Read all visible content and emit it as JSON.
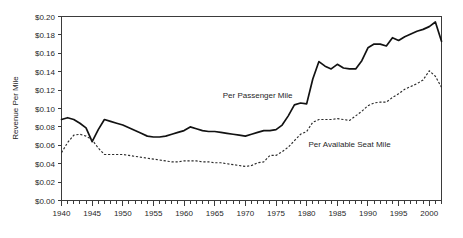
{
  "chart_data": {
    "type": "line",
    "title": "",
    "subtitle": "",
    "xlabel": "",
    "ylabel": "Revenue Per Mile",
    "xlim": [
      1940,
      2002
    ],
    "ylim": [
      0.0,
      0.2
    ],
    "grid": false,
    "legend_position": "inline-annotations",
    "y_tick_labels": [
      "$0.20",
      "$0.18",
      "$0.16",
      "$0.14",
      "$0.12",
      "$0.10",
      "$0.08",
      "$0.06",
      "$0.04",
      "$0.02",
      "$0.00"
    ],
    "y_tick_values": [
      0.2,
      0.18,
      0.16,
      0.14,
      0.12,
      0.1,
      0.08,
      0.06,
      0.04,
      0.02,
      0.0
    ],
    "x_tick_labels": [
      "1940",
      "1945",
      "1950",
      "1955",
      "1960",
      "1965",
      "1970",
      "1975",
      "1980",
      "1985",
      "1990",
      "1995",
      "2000"
    ],
    "x_tick_values": [
      1940,
      1945,
      1950,
      1955,
      1960,
      1965,
      1970,
      1975,
      1980,
      1985,
      1990,
      1995,
      2000
    ],
    "x_minor_tick_step": 1,
    "x": [
      1940,
      1941,
      1942,
      1943,
      1944,
      1945,
      1946,
      1947,
      1948,
      1949,
      1950,
      1951,
      1952,
      1953,
      1954,
      1955,
      1956,
      1957,
      1958,
      1959,
      1960,
      1961,
      1962,
      1963,
      1964,
      1965,
      1966,
      1967,
      1968,
      1969,
      1970,
      1971,
      1972,
      1973,
      1974,
      1975,
      1976,
      1977,
      1978,
      1979,
      1980,
      1981,
      1982,
      1983,
      1984,
      1985,
      1986,
      1987,
      1988,
      1989,
      1990,
      1991,
      1992,
      1993,
      1994,
      1995,
      1996,
      1997,
      1998,
      1999,
      2000,
      2001,
      2002
    ],
    "series": [
      {
        "name": "Per Passenger Mile",
        "style": "solid",
        "color": "#121212",
        "label_text": "Per Passenger Mile",
        "values": [
          0.088,
          0.09,
          0.088,
          0.084,
          0.079,
          0.064,
          0.077,
          0.088,
          0.086,
          0.084,
          0.082,
          0.079,
          0.076,
          0.073,
          0.07,
          0.069,
          0.069,
          0.07,
          0.072,
          0.074,
          0.076,
          0.08,
          0.078,
          0.076,
          0.075,
          0.075,
          0.074,
          0.073,
          0.072,
          0.071,
          0.07,
          0.072,
          0.074,
          0.076,
          0.076,
          0.077,
          0.082,
          0.092,
          0.104,
          0.106,
          0.105,
          0.132,
          0.151,
          0.146,
          0.143,
          0.148,
          0.144,
          0.143,
          0.143,
          0.152,
          0.166,
          0.17,
          0.17,
          0.168,
          0.177,
          0.174,
          0.178,
          0.181,
          0.184,
          0.186,
          0.189,
          0.194,
          0.173
        ]
      },
      {
        "name": "Per Available Seat Mile",
        "style": "dashed",
        "color": "#2b2b2b",
        "label_text": "Per Available Seat Mile",
        "values": [
          0.052,
          0.063,
          0.071,
          0.072,
          0.07,
          0.066,
          0.057,
          0.05,
          0.05,
          0.05,
          0.05,
          0.049,
          0.048,
          0.047,
          0.046,
          0.045,
          0.044,
          0.043,
          0.042,
          0.042,
          0.043,
          0.043,
          0.043,
          0.042,
          0.042,
          0.041,
          0.041,
          0.04,
          0.039,
          0.038,
          0.037,
          0.038,
          0.041,
          0.042,
          0.049,
          0.049,
          0.053,
          0.058,
          0.065,
          0.072,
          0.075,
          0.085,
          0.088,
          0.088,
          0.088,
          0.089,
          0.088,
          0.087,
          0.092,
          0.097,
          0.103,
          0.106,
          0.107,
          0.107,
          0.112,
          0.116,
          0.121,
          0.124,
          0.127,
          0.131,
          0.141,
          0.135,
          0.123
        ]
      }
    ],
    "annotations": [
      {
        "text": "Per Passenger Mile",
        "x": 1972.0,
        "y": 0.1115
      },
      {
        "text": "Per Available Seat Mile",
        "x": 1987.0,
        "y": 0.0585
      }
    ]
  }
}
